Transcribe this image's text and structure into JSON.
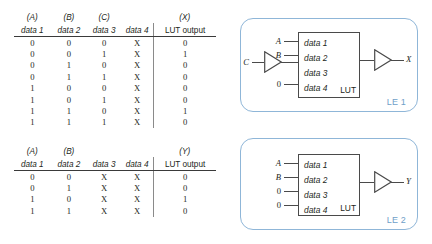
{
  "tables": [
    {
      "id": "lut-x",
      "signal_headers": [
        "(A)",
        "(B)",
        "(C)",
        "",
        "(X)"
      ],
      "column_headers": [
        "data 1",
        "data 2",
        "data 3",
        "data 4",
        "LUT output"
      ],
      "rows": [
        [
          "0",
          "0",
          "0",
          "X",
          "0"
        ],
        [
          "0",
          "0",
          "1",
          "X",
          "1"
        ],
        [
          "0",
          "1",
          "0",
          "X",
          "0"
        ],
        [
          "0",
          "1",
          "1",
          "X",
          "0"
        ],
        [
          "1",
          "0",
          "0",
          "X",
          "0"
        ],
        [
          "1",
          "0",
          "1",
          "X",
          "0"
        ],
        [
          "1",
          "1",
          "0",
          "X",
          "1"
        ],
        [
          "1",
          "1",
          "1",
          "X",
          "0"
        ]
      ]
    },
    {
      "id": "lut-y",
      "signal_headers": [
        "(A)",
        "(B)",
        "",
        "",
        "(Y)"
      ],
      "column_headers": [
        "data 1",
        "data 2",
        "data 3",
        "data 4",
        "LUT output"
      ],
      "rows": [
        [
          "0",
          "0",
          "X",
          "X",
          "0"
        ],
        [
          "0",
          "1",
          "X",
          "X",
          "0"
        ],
        [
          "1",
          "0",
          "X",
          "X",
          "1"
        ],
        [
          "1",
          "1",
          "X",
          "X",
          "0"
        ]
      ]
    }
  ],
  "logic_elements": [
    {
      "id": "le1",
      "label": "LE 1",
      "lut_label": "LUT",
      "lut_inputs": [
        "data 1",
        "data 2",
        "data 3",
        "data 4"
      ],
      "pin_labels": [
        "A",
        "B",
        "",
        "0"
      ],
      "gate_input_label": "C",
      "output_label": "X"
    },
    {
      "id": "le2",
      "label": "LE 2",
      "lut_label": "LUT",
      "lut_inputs": [
        "data 1",
        "data 2",
        "data 3",
        "data 4"
      ],
      "pin_labels": [
        "A",
        "B",
        "0",
        "0"
      ],
      "gate_input_label": "",
      "output_label": "Y"
    }
  ],
  "colors": {
    "panel_border": "#8fb6d8",
    "panel_label": "#6fa0c8",
    "line": "#4a4a4a",
    "text": "#231f20",
    "divider": "#8a8a8a"
  }
}
